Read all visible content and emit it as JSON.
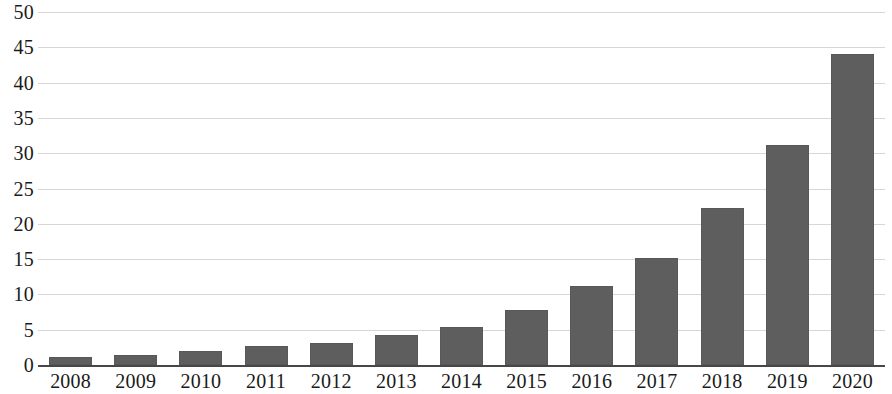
{
  "chart_data": {
    "type": "bar",
    "title": "",
    "subtitle": "",
    "xlabel": "",
    "ylabel": "",
    "categories": [
      "2008",
      "2009",
      "2010",
      "2011",
      "2012",
      "2013",
      "2014",
      "2015",
      "2016",
      "2017",
      "2018",
      "2019",
      "2020"
    ],
    "values": [
      1.1,
      1.4,
      2.0,
      2.7,
      3.1,
      4.2,
      5.4,
      7.8,
      11.2,
      15.2,
      22.2,
      31.2,
      44.0
    ],
    "ylim": [
      0,
      50
    ],
    "ytick_step": 5,
    "ytick_labels": [
      "0",
      "5",
      "10",
      "15",
      "20",
      "25",
      "30",
      "35",
      "40",
      "45",
      "50"
    ],
    "ytick_values": [
      0,
      5,
      10,
      15,
      20,
      25,
      30,
      35,
      40,
      45,
      50
    ],
    "grid": true,
    "grid_axis": "y",
    "legend": false,
    "legend_position": "none",
    "series": [
      {
        "name": "",
        "color": "#5e5e5e",
        "values": [
          1.1,
          1.4,
          2.0,
          2.7,
          3.1,
          4.2,
          5.4,
          7.8,
          11.2,
          15.2,
          22.2,
          31.2,
          44.0
        ]
      }
    ],
    "colors": {
      "bar": "#5e5e5e",
      "gridline": "#d4d4d4",
      "axis_line": "#3d3d3d",
      "text": "#1a1a1a",
      "background": "#ffffff"
    }
  }
}
